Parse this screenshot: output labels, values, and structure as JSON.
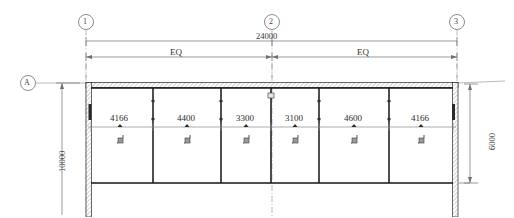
{
  "drawing": {
    "type": "architectural-floor-plan",
    "grid_bubbles_horizontal": [
      {
        "id": "1",
        "label": "1",
        "x": 86
      },
      {
        "id": "2",
        "label": "2",
        "x": 272
      },
      {
        "id": "3",
        "label": "3",
        "x": 457
      }
    ],
    "grid_bubbles_vertical": [
      {
        "id": "A",
        "label": "A",
        "y": 83
      }
    ],
    "overall_dimension": {
      "label": "24000",
      "units": "mm",
      "from_grid": "1",
      "to_grid": "3"
    },
    "equal_spans": [
      {
        "label": "EQ",
        "from_grid": "1",
        "to_grid": "2"
      },
      {
        "label": "EQ",
        "from_grid": "2",
        "to_grid": "3"
      }
    ],
    "vertical_dimensions": [
      {
        "label": "10000",
        "side": "left",
        "units": "mm"
      },
      {
        "label": "6000",
        "side": "right",
        "units": "mm"
      }
    ],
    "bays": [
      {
        "index": 1,
        "label": "4166",
        "x1": 91,
        "x2": 153
      },
      {
        "index": 2,
        "label": "4400",
        "x1": 153,
        "x2": 221
      },
      {
        "index": 3,
        "label": "3300",
        "x1": 221,
        "x2": 271
      },
      {
        "index": 4,
        "label": "3100",
        "x1": 271,
        "x2": 319
      },
      {
        "index": 5,
        "label": "4600",
        "x1": 319,
        "x2": 389
      },
      {
        "index": 6,
        "label": "4166",
        "x1": 389,
        "x2": 453
      }
    ],
    "door_symbol_name": "door-swing-icon",
    "colors": {
      "line": "#1a1a1a",
      "thin_line": "#6b6b6b",
      "dim_line": "#8a8a8a",
      "hatch": "#9a9a9a",
      "background": "#ffffff"
    }
  }
}
